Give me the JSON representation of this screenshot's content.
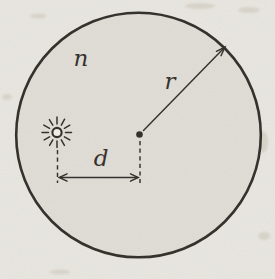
{
  "figure": {
    "labels": {
      "medium": "n",
      "radius": "r",
      "distance": "d"
    },
    "icons": {
      "light_source": "sun-burst-icon",
      "center": "center-dot",
      "radius_marker": "radius-arrow",
      "distance_marker": "double-headed-arrow"
    },
    "colors": {
      "paper": "#eae8e2",
      "circle_fill": "#e1dfd8",
      "ink": "#2e2b27"
    }
  }
}
